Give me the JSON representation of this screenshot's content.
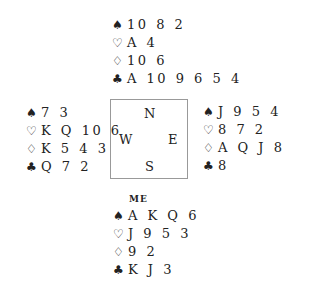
{
  "suits": {
    "spades": "♠",
    "hearts": "♡",
    "diamonds": "♢",
    "clubs": "♣"
  },
  "compass": {
    "north": "N",
    "west": "W",
    "east": "E",
    "south": "S"
  },
  "hands": {
    "north": {
      "label": "",
      "spades": "10 8 2",
      "hearts": "A 4",
      "diamonds": "10 6",
      "clubs": "A 10 9 6 5 4"
    },
    "west": {
      "label": "",
      "spades": "7 3",
      "hearts": "K Q 10 6",
      "diamonds": "K 5 4 3",
      "clubs": "Q 7 2"
    },
    "east": {
      "label": "",
      "spades": "J 9 5 4",
      "hearts": "8 7 2",
      "diamonds": "A Q J 8 7",
      "clubs": "8"
    },
    "south": {
      "label": "ME",
      "spades": "A K Q 6",
      "hearts": "J 9 5 3",
      "diamonds": "9 2",
      "clubs": "K J 3"
    }
  }
}
